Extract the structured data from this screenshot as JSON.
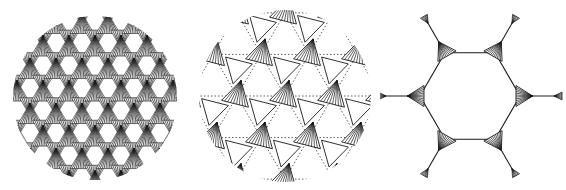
{
  "figure": {
    "background": "#ffffff",
    "ink": "#1a1a1a",
    "panels": [
      {
        "id": "a",
        "label": "dense-star-lattice",
        "shape": "disc",
        "center": [
          95,
          98
        ],
        "radius": 82,
        "triangle_size": 22,
        "spacing": 26
      },
      {
        "id": "b",
        "label": "kagome-triangle-lattice",
        "shape": "disc",
        "center": [
          285,
          96
        ],
        "radius": 86,
        "spacing": 48,
        "triangle_size": 16
      },
      {
        "id": "c",
        "label": "hexagonal-ring-unit",
        "center": [
          470,
          96
        ],
        "ring_radius": 50,
        "arm_length": 42,
        "triangle_size": 14,
        "tip_size": 8
      }
    ]
  }
}
